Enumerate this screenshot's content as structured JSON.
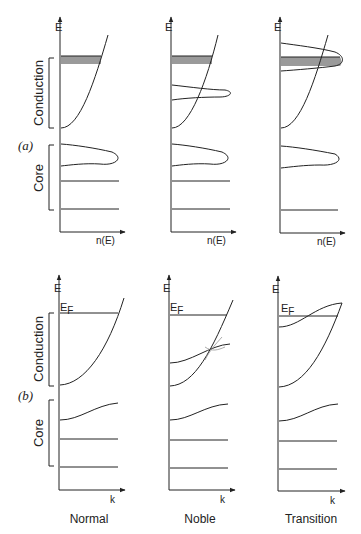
{
  "figure": {
    "panel_a": {
      "label": "(a)",
      "y_axis_label": "E",
      "x_axis_label": "n(E)",
      "bracket_labels": {
        "conduction": "Conduction",
        "core": "Core"
      },
      "columns": [
        "Normal",
        "Noble",
        "Transition"
      ]
    },
    "panel_b": {
      "label": "(b)",
      "y_axis_label": "E",
      "fermi_label": "E",
      "fermi_sub": "F",
      "x_axis_label": "k",
      "bracket_labels": {
        "conduction": "Conduction",
        "core": "Core"
      },
      "columns": [
        "Normal",
        "Noble",
        "Transition"
      ]
    },
    "column_titles": [
      "Normal",
      "Noble",
      "Transition"
    ],
    "colors": {
      "line": "#222222",
      "shade": "#9a9a9a"
    }
  }
}
